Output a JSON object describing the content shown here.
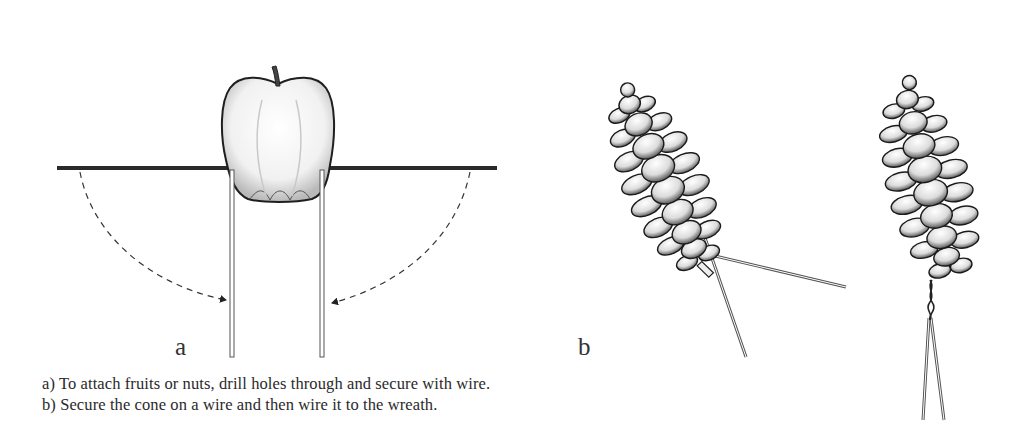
{
  "figure": {
    "panel_a": {
      "label": "a",
      "subject": "apple on a wire pushed through, wire ends bent down",
      "icons": [
        "apple-icon",
        "dashed-arrow-icon"
      ]
    },
    "panel_b": {
      "label": "b",
      "subject": "pine cone wired for wreath",
      "icons": [
        "pine-cone-icon",
        "twisted-wire-icon"
      ]
    },
    "captions": [
      "a) To attach fruits or nuts, drill holes through and secure with wire.",
      "b) Secure the cone on a wire and then wire it to the wreath."
    ],
    "colors": {
      "ink": "#222222",
      "background": "#ffffff"
    }
  }
}
